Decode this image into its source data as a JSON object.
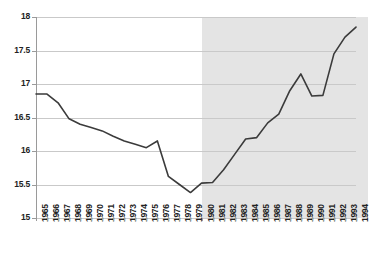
{
  "chart_data": {
    "type": "line",
    "title": "",
    "subtitle": "",
    "xlabel": "",
    "ylabel": "",
    "xlim": [
      1965,
      1994
    ],
    "ylim": [
      15,
      18
    ],
    "ytick_values": [
      15,
      15.5,
      16,
      16.5,
      17,
      17.5,
      18
    ],
    "ytick_labels": [
      "15",
      "15.5",
      "16",
      "16.5",
      "17",
      "17.5",
      "18"
    ],
    "grid": true,
    "legend": "none",
    "categories": [
      "1965",
      "1966",
      "1967",
      "1968",
      "1969",
      "1970",
      "1971",
      "1972",
      "1973",
      "1974",
      "1975",
      "1976",
      "1977",
      "1978",
      "1979",
      "1980",
      "1981",
      "1982",
      "1983",
      "1984",
      "1985",
      "1986",
      "1987",
      "1988",
      "1989",
      "1990",
      "1991",
      "1992",
      "1993",
      "1994"
    ],
    "values": [
      16.85,
      16.85,
      16.72,
      16.48,
      16.4,
      16.35,
      16.3,
      16.22,
      16.15,
      16.1,
      16.05,
      16.15,
      15.62,
      15.5,
      15.38,
      15.52,
      15.53,
      15.72,
      15.95,
      16.18,
      16.2,
      16.42,
      16.55,
      16.9,
      17.15,
      16.82,
      16.83,
      17.45,
      17.7,
      17.85
    ],
    "series": [
      {
        "name": "series-1",
        "values": [
          16.85,
          16.85,
          16.72,
          16.48,
          16.4,
          16.35,
          16.3,
          16.22,
          16.15,
          16.1,
          16.05,
          16.15,
          15.62,
          15.5,
          15.38,
          15.52,
          15.53,
          15.72,
          15.95,
          16.18,
          16.2,
          16.42,
          16.55,
          16.9,
          17.15,
          16.82,
          16.83,
          17.45,
          17.7,
          17.85
        ],
        "color": "#3b3b3b"
      }
    ],
    "annotations": [
      {
        "type": "shaded-band",
        "name": "highlight-band",
        "x_start": "1980",
        "x_end": "1994",
        "color": "#e4e4e4"
      }
    ],
    "colors": {
      "line": "#3b3b3b",
      "grid": "#c9c9c9",
      "axis": "#9a9a9a",
      "band": "#e4e4e4",
      "plot_background": "#ffffff",
      "text": "#222222"
    }
  }
}
